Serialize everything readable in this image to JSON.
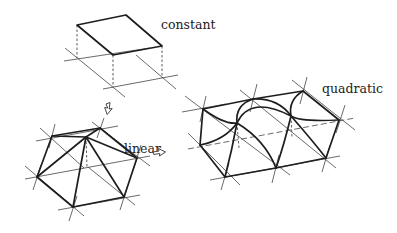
{
  "figure": {
    "panels": [
      {
        "id": "constant",
        "label": "constant"
      },
      {
        "id": "linear",
        "label": "linear"
      },
      {
        "id": "quadratic",
        "label": "quadratic"
      }
    ],
    "arrows": [
      {
        "from": "constant",
        "to": "linear",
        "direction": "down"
      },
      {
        "from": "linear",
        "to": "quadratic",
        "direction": "right"
      }
    ],
    "colors": {
      "ink": "#1e1e1e",
      "background": "#ffffff"
    }
  }
}
